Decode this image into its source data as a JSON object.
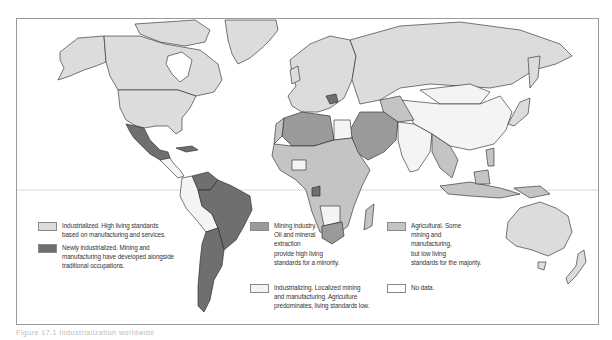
{
  "figure": {
    "caption": "Figure 17.1  Industrialization worldwide",
    "type": "world-choropleth-map",
    "shading_note": "Five grayscale categories of economic development"
  },
  "colors": {
    "industrialized": "#dcdcdc",
    "newly_industrialized": "#6f6f6f",
    "mining_industry": "#9a9a9a",
    "industrializing": "#f4f4f4",
    "agricultural": "#c4c4c4",
    "no_data": "#ffffff",
    "outline": "#222222",
    "frame": "#9a9a9a",
    "equator": "#cccccc"
  },
  "legend": [
    {
      "id": "industrialized",
      "text": "Industrialized. High living standards\nbased on manufacturing and services."
    },
    {
      "id": "newly_industrialized",
      "text": "Newly industrialized. Mining and\nmanufacturing have developed alongside\ntraditional occupations."
    },
    {
      "id": "mining_industry",
      "text": "Mining industry.\nOil and mineral\nextraction\nprovide high living\nstandards for a minority."
    },
    {
      "id": "industrializing",
      "text": "Industrializing. Localized mining\nand manufacturing. Agriculture\npredominates, living standards low."
    },
    {
      "id": "agricultural",
      "text": "Agricultural. Some\nmining and\nmanufacturing,\nbut low living\nstandards for the majority."
    },
    {
      "id": "no_data",
      "text": "No data."
    }
  ],
  "regions": {
    "industrialized": [
      "North America (USA, Canada)",
      "Western Europe",
      "Russia/USSR",
      "Japan",
      "Australia",
      "New Zealand",
      "Greenland"
    ],
    "newly_industrialized": [
      "Mexico",
      "Brazil",
      "Argentina",
      "Venezuela",
      "Yugoslavia"
    ],
    "mining_industry": [
      "Saudi Arabia",
      "Iran",
      "Iraq",
      "Libya",
      "Algeria",
      "Gulf States",
      "South Africa",
      "Gabon"
    ],
    "industrializing": [
      "China",
      "Mongolia",
      "Andean South America",
      "Egypt",
      "Central America",
      "India"
    ],
    "agricultural": [
      "Sub-Saharan Africa",
      "Southeast Asia",
      "Indonesia",
      "Central Asia"
    ]
  }
}
